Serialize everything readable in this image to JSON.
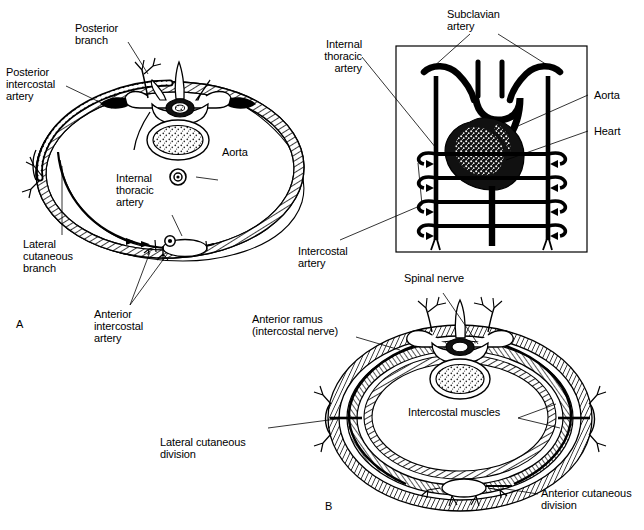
{
  "figure": {
    "background_color": "#ffffff",
    "ink_color": "#000000"
  },
  "panels": [
    {
      "id": "A",
      "letter": "A",
      "caption": "Arterial supply of the thoracic wall (transverse section)"
    },
    {
      "id": "B",
      "letter": "B",
      "caption": "Intercostal nerve distribution (transverse section)"
    }
  ],
  "panel_a": {
    "letter": "A",
    "labels": {
      "posterior_branch": "Posterior\nbranch",
      "posterior_intercostal_artery": "Posterior\nintercostal\nartery",
      "aorta": "Aorta",
      "internal_thoracic_artery": "Internal\nthoracic\nartery",
      "lateral_cutaneous_branch": "Lateral\ncutaneous\nbranch",
      "anterior_intercostal_artery": "Anterior\nintercostal\nartery"
    }
  },
  "panel_inset": {
    "labels": {
      "subclavian_artery": "Subclavian\nartery",
      "internal_thoracic_artery": "Internal\nthoracic\nartery",
      "aorta": "Aorta",
      "heart": "Heart",
      "intercostal_artery": "Intercostal\nartery"
    },
    "box": {
      "x": 396,
      "y": 46,
      "width": 191,
      "height": 206
    }
  },
  "panel_b": {
    "letter": "B",
    "labels": {
      "spinal_nerve": "Spinal nerve",
      "anterior_ramus": "Anterior ramus\n(intercostal nerve)",
      "intercostal_muscles": "Intercostal muscles",
      "lateral_cutaneous_division": "Lateral cutaneous\ndivision",
      "anterior_cutaneous_division": "Anterior cutaneous\ndivision"
    }
  },
  "colors": {
    "stroke": "#000000",
    "fill_white": "#ffffff",
    "stipple": "#8a8a8a"
  }
}
